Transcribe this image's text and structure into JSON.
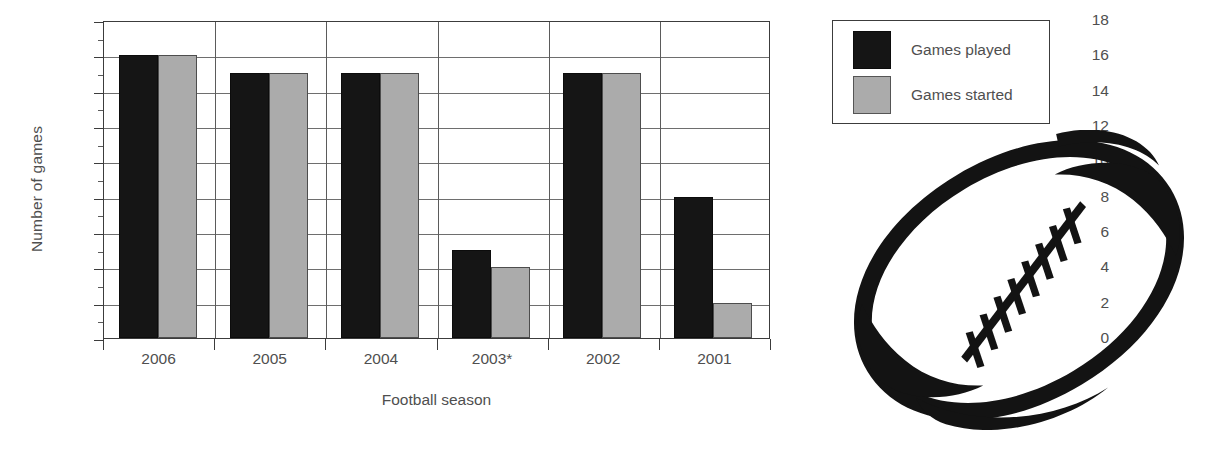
{
  "chart_data": {
    "type": "bar",
    "title": "",
    "xlabel": "Football season",
    "ylabel": "Number of games",
    "categories": [
      "2006",
      "2005",
      "2004",
      "2003*",
      "2002",
      "2001"
    ],
    "series": [
      {
        "name": "Games played",
        "color": "#151515",
        "values": [
          16,
          15,
          15,
          5,
          15,
          8
        ]
      },
      {
        "name": "Games started",
        "color": "#ababab",
        "values": [
          16,
          15,
          15,
          4,
          15,
          2
        ]
      }
    ],
    "ylim": [
      0,
      18
    ],
    "ytick_labels": [
      "0",
      "2",
      "4",
      "6",
      "8",
      "10",
      "12",
      "14",
      "16",
      "18"
    ],
    "ytick_values": [
      0,
      2,
      4,
      6,
      8,
      10,
      12,
      14,
      16,
      18
    ],
    "yminor_step": 1,
    "grid": "horizontal-and-vertical",
    "legend_position": "upper-right-outside",
    "footnote_marker": "*"
  },
  "axes": {
    "y_title": "Number of games",
    "x_title": "Football season"
  },
  "legend": {
    "entries": [
      {
        "label": "Games played",
        "swatch": "black-square"
      },
      {
        "label": "Games started",
        "swatch": "gray-square"
      }
    ]
  },
  "artwork": {
    "name": "american-football-illustration",
    "description": "Stylized black outline of an American football with laces, tilted"
  },
  "colors": {
    "played": "#151515",
    "started": "#ababab",
    "axis": "#3c3c3c",
    "grid": "#6e6e6e",
    "text": "#4f4f4f",
    "background": "#ffffff"
  }
}
